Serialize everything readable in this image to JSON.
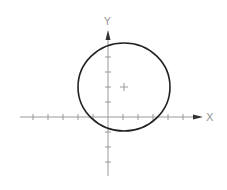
{
  "diagram": {
    "type": "circle-on-axes",
    "axes": {
      "x_label": "X",
      "y_label": "Y",
      "origin_px": [
        108,
        117
      ],
      "unit_px": 15,
      "x_ticks": [
        -5,
        -4,
        -3,
        -2,
        -1,
        1,
        2,
        3,
        4,
        5
      ],
      "y_ticks": [
        -3,
        -2,
        -1,
        1,
        2,
        3,
        4
      ]
    },
    "circle": {
      "center": [
        1,
        2
      ],
      "radius": 3,
      "stroke": "#222222"
    },
    "colors": {
      "axis": "#9a9a9a",
      "circle": "#222222"
    }
  }
}
